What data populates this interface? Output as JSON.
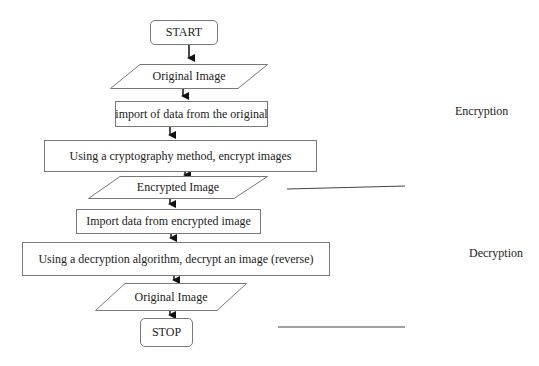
{
  "flowchart": {
    "nodes": [
      {
        "id": "start",
        "shape": "terminator",
        "label": "START"
      },
      {
        "id": "input-original",
        "shape": "parallelogram",
        "label": "Original Image"
      },
      {
        "id": "import-original",
        "shape": "process",
        "label": "import of data from the original"
      },
      {
        "id": "encrypt",
        "shape": "process",
        "label": "Using a cryptography method, encrypt images"
      },
      {
        "id": "encrypted-image",
        "shape": "parallelogram",
        "label": "Encrypted Image"
      },
      {
        "id": "import-encrypted",
        "shape": "process",
        "label": "Import data from encrypted image"
      },
      {
        "id": "decrypt",
        "shape": "process",
        "label": "Using a decryption algorithm, decrypt an image (reverse)"
      },
      {
        "id": "output-original",
        "shape": "parallelogram",
        "label": "Original Image"
      },
      {
        "id": "stop",
        "shape": "terminator",
        "label": "STOP"
      }
    ],
    "sections": [
      {
        "label": "Encryption"
      },
      {
        "label": "Decryption"
      }
    ]
  }
}
